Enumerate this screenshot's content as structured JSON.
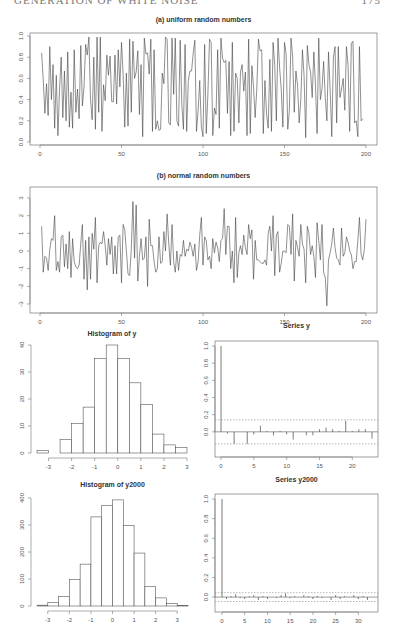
{
  "header": {
    "running_title": "GENERATION OF WHITE NOISE",
    "page_number": "175"
  },
  "chart_data": [
    {
      "id": "uniform",
      "type": "line",
      "title": "(a) uniform random numbers",
      "xlabel": "",
      "ylabel": "",
      "xlim": [
        0,
        200
      ],
      "ylim": [
        0,
        1
      ],
      "xticks": [
        0,
        50,
        100,
        150,
        200
      ],
      "yticks": [
        0.0,
        0.2,
        0.4,
        0.6,
        0.8,
        1.0
      ],
      "ytick_labels": [
        "0.0",
        "0.2",
        "0.4",
        "0.6",
        "0.8",
        "1.0"
      ],
      "n": 200,
      "values": [
        0.84,
        0.58,
        0.27,
        0.55,
        0.25,
        0.9,
        0.4,
        0.73,
        0.13,
        0.63,
        0.06,
        0.5,
        0.8,
        0.23,
        0.67,
        0.2,
        0.85,
        0.14,
        0.47,
        0.13,
        0.87,
        0.28,
        0.5,
        0.22,
        0.91,
        0.34,
        0.52,
        0.92,
        0.82,
        0.99,
        0.4,
        0.21,
        0.8,
        0.12,
        0.99,
        0.28,
        0.99,
        0.1,
        0.54,
        0.39,
        0.82,
        0.63,
        0.81,
        0.38,
        0.38,
        0.82,
        0.36,
        0.87,
        0.52,
        0.94,
        0.64,
        0.14,
        0.65,
        0.15,
        0.97,
        0.28,
        0.95,
        0.6,
        0.66,
        0.86,
        0.26,
        0.73,
        0.05,
        0.98,
        0.83,
        0.84,
        0.64,
        0.97,
        0.1,
        0.87,
        0.12,
        0.2,
        0.11,
        0.12,
        0.65,
        0.55,
        0.99,
        0.97,
        0.18,
        0.16,
        0.98,
        0.45,
        0.98,
        0.2,
        0.15,
        0.96,
        0.36,
        0.12,
        0.92,
        0.1,
        0.58,
        0.67,
        0.67,
        0.84,
        0.96,
        0.1,
        0.29,
        0.58,
        0.14,
        0.05,
        0.92,
        0.08,
        0.45,
        0.97,
        0.94,
        0.06,
        0.32,
        0.26,
        0.87,
        0.13,
        0.98,
        0.79,
        0.75,
        0.77,
        0.27,
        0.76,
        0.06,
        0.94,
        0.1,
        0.65,
        0.6,
        0.18,
        0.66,
        0.73,
        0.48,
        0.66,
        0.06,
        0.97,
        0.08,
        0.72,
        0.52,
        0.23,
        0.5,
        0.97,
        0.86,
        0.87,
        0.08,
        0.58,
        0.26,
        0.13,
        0.78,
        0.1,
        0.94,
        0.73,
        0.2,
        0.98,
        0.7,
        0.5,
        0.14,
        0.94,
        0.83,
        0.12,
        0.3,
        0.98,
        0.8,
        0.28,
        0.67,
        0.54,
        0.18,
        0.4,
        0.87,
        0.63,
        0.04,
        0.91,
        0.73,
        0.66,
        0.42,
        0.85,
        0.54,
        0.08,
        0.98,
        0.4,
        0.5,
        0.76,
        0.42,
        0.2,
        0.85,
        0.5,
        0.05,
        0.8,
        0.9,
        0.18,
        0.9,
        0.42,
        0.5,
        0.6,
        0.3,
        0.9,
        0.72,
        0.1,
        0.93,
        0.95,
        0.18,
        0.2,
        0.05,
        0.9,
        0.2,
        0.22
      ]
    },
    {
      "id": "normal",
      "type": "line",
      "title": "(b) normal random numbers",
      "xlabel": "",
      "ylabel": "",
      "xlim": [
        0,
        200
      ],
      "ylim": [
        -3,
        3
      ],
      "xticks": [
        0,
        50,
        100,
        150,
        200
      ],
      "yticks": [
        -3,
        -2,
        -1,
        0,
        1,
        2,
        3
      ],
      "n": 200,
      "values": [
        1.4,
        -1.2,
        -0.3,
        -0.4,
        -1.1,
        0.1,
        0.7,
        0.6,
        2.0,
        -1.1,
        -0.6,
        -1.2,
        0.8,
        0.9,
        -0.9,
        0.4,
        -1.0,
        1.1,
        -1.5,
        0.7,
        -0.6,
        -0.9,
        -1.0,
        -0.8,
        0.4,
        1.5,
        -1.6,
        0.6,
        -2.2,
        0.8,
        -1.6,
        1.0,
        0.1,
        1.9,
        -1.8,
        0.3,
        0.5,
        0.4,
        1.1,
        0.3,
        -0.8,
        0.7,
        -0.2,
        0.8,
        -1.3,
        0.3,
        -1.3,
        0.8,
        0.9,
        -1.8,
        1.5,
        1.2,
        0.0,
        -1.3,
        -1.4,
        0.1,
        2.8,
        -0.4,
        2.6,
        -1.7,
        -0.3,
        0.7,
        -0.5,
        -0.4,
        0.8,
        -2.0,
        1.8,
        0.3,
        0.3,
        -0.6,
        -1.2,
        -1.0,
        0.8,
        -0.7,
        -0.6,
        1.1,
        0.0,
        2.1,
        0.4,
        -0.8,
        1.5,
        -0.6,
        -1.2,
        0.0,
        -1.1,
        -0.2,
        -0.3,
        0.6,
        -0.3,
        0.1,
        0.0,
        0.5,
        0.2,
        -0.3,
        0.4,
        -1.1,
        -0.6,
        0.9,
        1.9,
        -0.8,
        0.8,
        0.6,
        -0.5,
        -0.3,
        -1.0,
        0.7,
        -0.1,
        0.5,
        0.2,
        -0.6,
        0.6,
        0.7,
        2.4,
        -0.2,
        1.4,
        1.4,
        -1.0,
        0.0,
        -1.8,
        1.9,
        -1.5,
        -0.1,
        0.3,
        -0.2,
        0.9,
        0.2,
        -0.2,
        1.5,
        0.7,
        1.2,
        -1.6,
        0.6,
        -0.5,
        -0.5,
        -0.6,
        -0.7,
        -0.7,
        -0.5,
        -0.8,
        1.0,
        1.4,
        0.0,
        2.0,
        -1.4,
        0.9,
        1.1,
        -1.2,
        -0.7,
        0.0,
        0.0,
        -0.1,
        1.5,
        1.4,
        -0.2,
        2.1,
        -1.7,
        0.6,
        0.2,
        -0.3,
        1.5,
        0.4,
        0.1,
        -1.8,
        1.4,
        1.0,
        -0.2,
        0.3,
        -0.3,
        -1.5,
        1.6,
        0.6,
        -0.5,
        1.5,
        -1.2,
        -1.5,
        -3.1,
        -0.5,
        -0.1,
        0.4,
        1.3,
        0.2,
        -0.4,
        -0.5,
        -0.8,
        1.3,
        -0.3,
        -0.1,
        0.8,
        0.5,
        0.0,
        -0.2,
        -1.0,
        -0.6,
        -0.6,
        0.6,
        1.9,
        -0.2,
        -0.5,
        0.1,
        1.8
      ]
    },
    {
      "id": "hist_y",
      "type": "bar",
      "title": "Histogram of y",
      "xlabel": "",
      "ylabel": "",
      "bin_edges": [
        -3.5,
        -3,
        -2.5,
        -2,
        -1.5,
        -1,
        -0.5,
        0,
        0.5,
        1,
        1.5,
        2,
        2.5,
        3
      ],
      "values": [
        1,
        0,
        5,
        11,
        17,
        35,
        40,
        35,
        26,
        18,
        7,
        3,
        2
      ],
      "xlim": [
        -3.5,
        3
      ],
      "ylim": [
        0,
        40
      ],
      "xticks": [
        -3,
        -2,
        -1,
        0,
        1,
        2,
        3
      ],
      "yticks": [
        0,
        10,
        20,
        30,
        40
      ]
    },
    {
      "id": "acf_y",
      "type": "bar",
      "subtype": "acf",
      "title": "Series  y",
      "xlabel": "",
      "ylabel": "",
      "lags": [
        0,
        1,
        2,
        3,
        4,
        5,
        6,
        7,
        8,
        9,
        10,
        11,
        12,
        13,
        14,
        15,
        16,
        17,
        18,
        19,
        20,
        21,
        22,
        23
      ],
      "values": [
        1.0,
        -0.02,
        -0.14,
        0.0,
        -0.14,
        -0.03,
        0.07,
        0.01,
        -0.04,
        0.01,
        -0.03,
        -0.09,
        0.0,
        -0.04,
        -0.04,
        0.03,
        0.05,
        0.03,
        0.01,
        0.13,
        0.01,
        0.03,
        0.03,
        -0.08
      ],
      "ci": 0.14,
      "xlim": [
        0,
        23
      ],
      "ylim": [
        -0.2,
        1.0
      ],
      "xticks": [
        0,
        5,
        10,
        15,
        20
      ],
      "yticks": [
        0.0,
        0.2,
        0.4,
        0.6,
        0.8,
        1.0
      ],
      "ytick_labels": [
        "0.0",
        "0.2",
        "0.4",
        "0.6",
        "0.8",
        "1.0"
      ]
    },
    {
      "id": "hist_y2000",
      "type": "bar",
      "title": "Histogram of y2000",
      "xlabel": "",
      "ylabel": "",
      "bin_edges": [
        -3.5,
        -3,
        -2.5,
        -2,
        -1.5,
        -1,
        -0.5,
        0,
        0.5,
        1,
        1.5,
        2,
        2.5,
        3,
        3.5
      ],
      "values": [
        3,
        13,
        35,
        98,
        155,
        330,
        373,
        393,
        298,
        196,
        73,
        30,
        10,
        2
      ],
      "xlim": [
        -3.5,
        3.5
      ],
      "ylim": [
        0,
        400
      ],
      "xticks": [
        -3,
        -2,
        -1,
        0,
        1,
        2,
        3
      ],
      "yticks": [
        0,
        100,
        200,
        300,
        400
      ]
    },
    {
      "id": "acf_y2000",
      "type": "bar",
      "subtype": "acf",
      "title": "Series  y2000",
      "xlabel": "",
      "ylabel": "",
      "lags": [
        0,
        1,
        2,
        3,
        4,
        5,
        6,
        7,
        8,
        9,
        10,
        11,
        12,
        13,
        14,
        15,
        16,
        17,
        18,
        19,
        20,
        21,
        22,
        23,
        24,
        25,
        26,
        27,
        28,
        29,
        30,
        31,
        32,
        33
      ],
      "values": [
        1.0,
        -0.02,
        0.01,
        0.03,
        -0.01,
        -0.02,
        0.01,
        0.02,
        -0.03,
        0.01,
        -0.02,
        0.0,
        -0.01,
        0.02,
        0.04,
        -0.01,
        0.01,
        0.0,
        0.02,
        0.01,
        -0.02,
        0.01,
        -0.01,
        0.0,
        -0.03,
        0.02,
        -0.02,
        0.01,
        0.0,
        0.02,
        -0.02,
        0.01,
        -0.03,
        0.0
      ],
      "ci": 0.045,
      "xlim": [
        0,
        33
      ],
      "ylim": [
        -0.05,
        1.0
      ],
      "xticks": [
        0,
        5,
        10,
        15,
        20,
        25,
        30
      ],
      "yticks": [
        0.0,
        0.2,
        0.4,
        0.6,
        0.8,
        1.0
      ],
      "ytick_labels": [
        "0.0",
        "0.2",
        "0.4",
        "0.6",
        "0.8",
        "1.0"
      ]
    }
  ]
}
